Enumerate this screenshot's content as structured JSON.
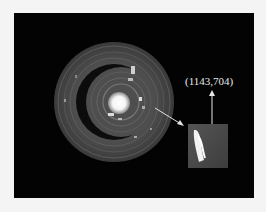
{
  "figure": {
    "coordinate_label": "(1143,704)",
    "colors": {
      "background": "#f4f4f4",
      "panel": "#030303",
      "ring": "#4a4a4a",
      "bright": "#ffffff",
      "arrow": "#e0e0e0"
    }
  }
}
